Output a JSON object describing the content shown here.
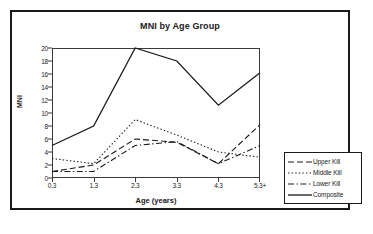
{
  "chart_data": {
    "type": "line",
    "title": "MNI by Age Group",
    "xlabel": "Age (years)",
    "ylabel": "MNI",
    "categories": [
      "0.3",
      "1.3",
      "2.3",
      "3.3",
      "4.3",
      "5.3+"
    ],
    "x_tick_labels": [
      "0.3",
      "1.3",
      "2.3",
      "3.3",
      "4.3",
      "5.3+"
    ],
    "y_tick_labels": [
      "0",
      "2",
      "4",
      "6",
      "8",
      "10",
      "12",
      "14",
      "16",
      "18",
      "20"
    ],
    "y_ticks": [
      0,
      2,
      4,
      6,
      8,
      10,
      12,
      14,
      16,
      18,
      20
    ],
    "ylim": [
      0,
      20
    ],
    "grid": false,
    "legend_position": "right-outside",
    "series": [
      {
        "name": "Upper Kill",
        "style": "dashed",
        "color": "#1a1a1a",
        "values": [
          1,
          2,
          6,
          5.5,
          2.2,
          8.2
        ]
      },
      {
        "name": "Middle Kill",
        "style": "dotted",
        "color": "#1a1a1a",
        "values": [
          3,
          2.2,
          9,
          6.6,
          4,
          3.2
        ]
      },
      {
        "name": "Lower Kill",
        "style": "dash-dot",
        "color": "#1a1a1a",
        "values": [
          1,
          1,
          5,
          5.6,
          2.2,
          5
        ]
      },
      {
        "name": "Composite",
        "style": "solid",
        "color": "#1a1a1a",
        "values": [
          5,
          8,
          20,
          18,
          11.2,
          16.2
        ]
      }
    ]
  },
  "legend": {
    "items": [
      {
        "label": "Upper Kill",
        "style": "dashed"
      },
      {
        "label": "Middle Kill",
        "style": "dotted"
      },
      {
        "label": "Lower Kill",
        "style": "dash-dot"
      },
      {
        "label": "Composite",
        "style": "solid"
      }
    ]
  }
}
